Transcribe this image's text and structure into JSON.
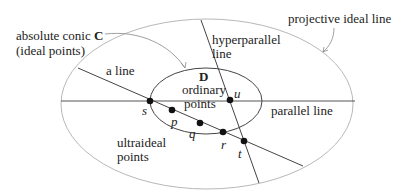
{
  "labels": {
    "absolute_conic_text": "absolute conic",
    "absolute_conic_symbol": "C",
    "ideal_points": "(ideal points)",
    "hyperparallel_line_1": "hyperparallel",
    "hyperparallel_line_2": "line",
    "projective_ideal_line": "projective ideal line",
    "a_line": "a line",
    "disk_symbol": "D",
    "ordinary_points_1": "ordinary",
    "ordinary_points_2": "points",
    "parallel_line": "parallel line",
    "ultraideal_points_1": "ultraideal",
    "ultraideal_points_2": "points"
  },
  "points": {
    "s": "s",
    "p": "p",
    "q": "q",
    "r": "r",
    "t": "t",
    "u": "u"
  },
  "colors": {
    "outer_conic": "#b0b0b0",
    "lines": "#444444",
    "points": "#111111",
    "text": "#222222"
  }
}
